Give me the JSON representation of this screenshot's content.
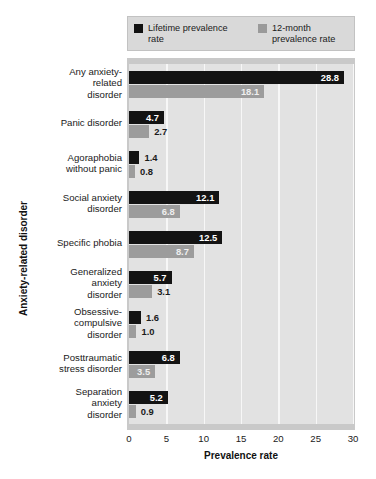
{
  "chart_data": {
    "type": "bar",
    "orientation": "horizontal",
    "title": "",
    "xlabel": "Prevalence rate",
    "ylabel": "Anxiety-related disorder",
    "xlim": [
      0,
      30
    ],
    "xticks": [
      "0",
      "5",
      "10",
      "15",
      "20",
      "25",
      "30"
    ],
    "grid": true,
    "legend_position": "top",
    "categories": [
      "Any anxiety-related disorder",
      "Panic disorder",
      "Agoraphobia without panic",
      "Social anxiety disorder",
      "Specific phobia",
      "Generalized anxiety disorder",
      "Obsessive-compulsive disorder",
      "Posttraumatic stress disorder",
      "Separation anxiety disorder"
    ],
    "category_lines": [
      [
        "Any anxiety-",
        "related",
        "disorder"
      ],
      [
        "Panic disorder"
      ],
      [
        "Agoraphobia",
        "without panic"
      ],
      [
        "Social anxiety",
        "disorder"
      ],
      [
        "Specific phobia"
      ],
      [
        "Generalized",
        "anxiety",
        "disorder"
      ],
      [
        "Obsessive-",
        "compulsive",
        "disorder"
      ],
      [
        "Posttraumatic",
        "stress disorder"
      ],
      [
        "Separation",
        "anxiety",
        "disorder"
      ]
    ],
    "series": [
      {
        "name": "Lifetime prevalence rate",
        "color": "#131313",
        "values": [
          28.8,
          4.7,
          1.4,
          12.1,
          12.5,
          5.7,
          1.6,
          6.8,
          5.2
        ],
        "labels": [
          "28.8",
          "4.7",
          "1.4",
          "12.1",
          "12.5",
          "5.7",
          "1.6",
          "6.8",
          "5.2"
        ]
      },
      {
        "name": "12-month prevalence rate",
        "color": "#9c9c9c",
        "values": [
          18.1,
          2.7,
          0.8,
          6.8,
          8.7,
          3.1,
          1.0,
          3.5,
          0.9
        ],
        "labels": [
          "18.1",
          "2.7",
          "0.8",
          "6.8",
          "8.7",
          "3.1",
          "1.0",
          "3.5",
          "0.9"
        ]
      }
    ]
  },
  "legend": {
    "entries": [
      {
        "label_line1": "Lifetime prevalence",
        "label_line2": "rate",
        "swatch": "black-swatch-icon"
      },
      {
        "label_line1": "12-month",
        "label_line2": "prevalence rate",
        "swatch": "gray-swatch-icon"
      }
    ]
  },
  "axes": {
    "x_title": "Prevalence rate",
    "y_title": "Anxiety-related disorder",
    "x_ticks": [
      "0",
      "5",
      "10",
      "15",
      "20",
      "25",
      "30"
    ]
  },
  "colors": {
    "lifetime": "#131313",
    "twelve_month": "#9c9c9c",
    "plot_background": "#e2e2e2",
    "frame": "#c9c9c9",
    "legend_background": "#d9d9d9",
    "gridline": "#f7f7f7"
  }
}
